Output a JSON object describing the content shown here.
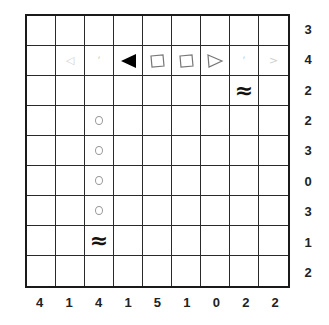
{
  "puzzle": {
    "rows": 9,
    "cols": 9,
    "row_clues": [
      "3",
      "4",
      "2",
      "2",
      "3",
      "0",
      "3",
      "1",
      "2"
    ],
    "col_clues": [
      "4",
      "1",
      "4",
      "1",
      "5",
      "1",
      "0",
      "2",
      "2"
    ],
    "cells": [
      [
        "",
        "",
        "",
        "",
        "",
        "",
        "",
        "",
        ""
      ],
      [
        "",
        "faint-left",
        "faint-mark",
        "ship-end-left",
        "ship-middle-outline",
        "ship-middle-outline",
        "ship-end-right-outline",
        "faint-mark",
        "faint-right"
      ],
      [
        "",
        "",
        "",
        "",
        "",
        "",
        "",
        "water",
        ""
      ],
      [
        "",
        "",
        "faint-circle",
        "",
        "",
        "",
        "",
        "",
        ""
      ],
      [
        "",
        "",
        "faint-circle",
        "",
        "",
        "",
        "",
        "",
        ""
      ],
      [
        "",
        "",
        "faint-circle",
        "",
        "",
        "",
        "",
        "",
        ""
      ],
      [
        "",
        "",
        "faint-circle",
        "",
        "",
        "",
        "",
        "",
        ""
      ],
      [
        "",
        "",
        "water",
        "",
        "",
        "",
        "",
        "",
        ""
      ],
      [
        "",
        "",
        "",
        "",
        "",
        "",
        "",
        "",
        ""
      ]
    ],
    "glyphs": {
      "water": "≈",
      "faint-mark": "ʼ",
      "faint-left": "◁",
      "faint-right": ">"
    }
  }
}
